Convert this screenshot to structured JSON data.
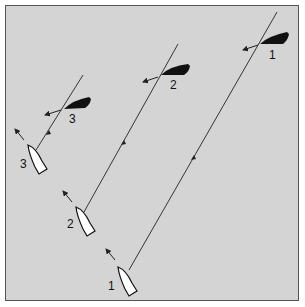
{
  "diagram": {
    "colors": {
      "background": "#d4d4d4",
      "border": "#555555",
      "black_boat": "#111111",
      "white_boat": "#ffffff",
      "track": "#222222"
    },
    "positions": [
      {
        "label": "1",
        "white_boat_label": "1",
        "black_boat_label": "1"
      },
      {
        "label": "2",
        "white_boat_label": "2",
        "black_boat_label": "2"
      },
      {
        "label": "3",
        "white_boat_label": "3",
        "black_boat_label": "3"
      }
    ]
  }
}
